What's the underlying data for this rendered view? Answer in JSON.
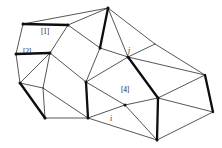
{
  "figure": {
    "kind": "triangular-mesh-diagram",
    "width": 222,
    "height": 148,
    "background_color": "#ffffff",
    "thin_edge_color": "#2b2b2b",
    "bold_edge_color": "#0d0d0d",
    "label_color": "#1a1a1a"
  },
  "labels": [
    {
      "name": "edge-label-1",
      "text": "[1]",
      "style": "bracket",
      "x": 41,
      "y": 28
    },
    {
      "name": "edge-label-2",
      "text": "[2]",
      "style": "bracket",
      "x": 23,
      "y": 48
    },
    {
      "name": "edge-label-4",
      "text": "[4]",
      "style": "bracket",
      "x": 121,
      "y": 86
    },
    {
      "name": "node-label-j",
      "text": "j",
      "style": "italic",
      "x": 128,
      "y": 47
    },
    {
      "name": "node-label-i",
      "text": "i",
      "style": "italic",
      "x": 110,
      "y": 115
    }
  ],
  "mesh_data": {
    "type": "mesh",
    "vertices": [
      {
        "id": "v0",
        "x": 108,
        "y": 8
      },
      {
        "id": "v1",
        "x": 23,
        "y": 24
      },
      {
        "id": "v2",
        "x": 68,
        "y": 25
      },
      {
        "id": "v3",
        "x": 16,
        "y": 54
      },
      {
        "id": "v4",
        "x": 50,
        "y": 53
      },
      {
        "id": "v5",
        "x": 100,
        "y": 48
      },
      {
        "id": "v6",
        "x": 128,
        "y": 57
      },
      {
        "id": "v7",
        "x": 155,
        "y": 44
      },
      {
        "id": "v8",
        "x": 205,
        "y": 75
      },
      {
        "id": "v9",
        "x": 20,
        "y": 83
      },
      {
        "id": "v10",
        "x": 43,
        "y": 88
      },
      {
        "id": "v11",
        "x": 86,
        "y": 82
      },
      {
        "id": "v12",
        "x": 158,
        "y": 98
      },
      {
        "id": "v13",
        "x": 45,
        "y": 118
      },
      {
        "id": "v14",
        "x": 88,
        "y": 118
      },
      {
        "id": "v15",
        "x": 125,
        "y": 105
      },
      {
        "id": "v16",
        "x": 157,
        "y": 140
      },
      {
        "id": "v17",
        "x": 213,
        "y": 112
      }
    ],
    "edges": [
      {
        "from": "v1",
        "to": "v2",
        "weight": "bold"
      },
      {
        "from": "v2",
        "to": "v0",
        "weight": "thin"
      },
      {
        "from": "v1",
        "to": "v0",
        "weight": "thin"
      },
      {
        "from": "v1",
        "to": "v3",
        "weight": "thin"
      },
      {
        "from": "v2",
        "to": "v4",
        "weight": "thin"
      },
      {
        "from": "v3",
        "to": "v4",
        "weight": "bold"
      },
      {
        "from": "v2",
        "to": "v5",
        "weight": "thin"
      },
      {
        "from": "v0",
        "to": "v5",
        "weight": "bold"
      },
      {
        "from": "v0",
        "to": "v6",
        "weight": "thin"
      },
      {
        "from": "v0",
        "to": "v7",
        "weight": "thin"
      },
      {
        "from": "v5",
        "to": "v6",
        "weight": "thin"
      },
      {
        "from": "v6",
        "to": "v7",
        "weight": "thin"
      },
      {
        "from": "v7",
        "to": "v8",
        "weight": "thin"
      },
      {
        "from": "v6",
        "to": "v8",
        "weight": "thin"
      },
      {
        "from": "v3",
        "to": "v9",
        "weight": "thin"
      },
      {
        "from": "v4",
        "to": "v9",
        "weight": "thin"
      },
      {
        "from": "v4",
        "to": "v10",
        "weight": "thin"
      },
      {
        "from": "v9",
        "to": "v10",
        "weight": "thin"
      },
      {
        "from": "v4",
        "to": "v11",
        "weight": "thin"
      },
      {
        "from": "v5",
        "to": "v11",
        "weight": "thin"
      },
      {
        "from": "v6",
        "to": "v11",
        "weight": "thin"
      },
      {
        "from": "v6",
        "to": "v12",
        "weight": "bold"
      },
      {
        "from": "v8",
        "to": "v12",
        "weight": "thin"
      },
      {
        "from": "v8",
        "to": "v17",
        "weight": "bold"
      },
      {
        "from": "v9",
        "to": "v13",
        "weight": "bold"
      },
      {
        "from": "v10",
        "to": "v13",
        "weight": "thin"
      },
      {
        "from": "v10",
        "to": "v14",
        "weight": "thin"
      },
      {
        "from": "v11",
        "to": "v14",
        "weight": "bold"
      },
      {
        "from": "v13",
        "to": "v14",
        "weight": "thin"
      },
      {
        "from": "v11",
        "to": "v15",
        "weight": "thin"
      },
      {
        "from": "v14",
        "to": "v15",
        "weight": "thin"
      },
      {
        "from": "v12",
        "to": "v15",
        "weight": "thin"
      },
      {
        "from": "v14",
        "to": "v16",
        "weight": "thin"
      },
      {
        "from": "v15",
        "to": "v16",
        "weight": "thin"
      },
      {
        "from": "v12",
        "to": "v16",
        "weight": "bold"
      },
      {
        "from": "v12",
        "to": "v17",
        "weight": "thin"
      },
      {
        "from": "v16",
        "to": "v17",
        "weight": "thin"
      }
    ],
    "vertex_markers": [
      "v0",
      "v1",
      "v2",
      "v3",
      "v4",
      "v5",
      "v6",
      "v9",
      "v11",
      "v12",
      "v13",
      "v14",
      "v15",
      "v16"
    ]
  }
}
